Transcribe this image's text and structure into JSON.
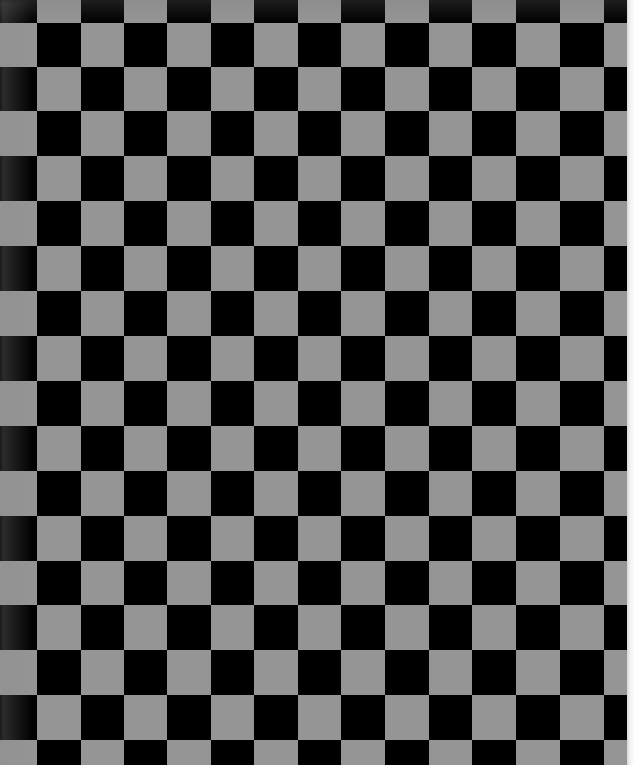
{
  "image": {
    "subject": "checkerboard calibration pattern",
    "width": 635,
    "height": 765
  },
  "board": {
    "colors": {
      "light": "#959595",
      "dark": "#000000",
      "paper_edge": "#f2f2f2"
    },
    "col_edges": [
      0,
      37,
      81,
      124,
      167,
      211,
      254,
      298,
      341,
      385,
      429,
      472,
      516,
      560,
      604,
      628
    ],
    "row_edges": [
      0,
      23,
      67,
      111,
      156,
      201,
      246,
      291,
      336,
      381,
      426,
      471,
      516,
      561,
      605,
      650,
      695,
      740,
      765
    ],
    "light_when_index_sum": "odd",
    "paper_edge_x": 627
  }
}
